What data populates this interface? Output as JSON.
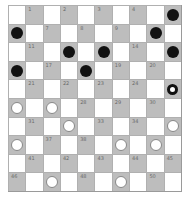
{
  "board": {
    "size": 10,
    "colors": {
      "light": "#ffffff",
      "dark": "#bdbdbd",
      "black_piece": "#111111",
      "white_piece": "#ffffff"
    },
    "pieces": {
      "5": "black",
      "6": "black",
      "10": "black",
      "12": "black",
      "13": "black",
      "15": "black",
      "16": "black",
      "18": "black",
      "25": "ring",
      "26": "white",
      "27": "white",
      "32": "white",
      "35": "white",
      "36": "white",
      "39": "white",
      "40": "white",
      "47": "white",
      "49": "white"
    }
  }
}
